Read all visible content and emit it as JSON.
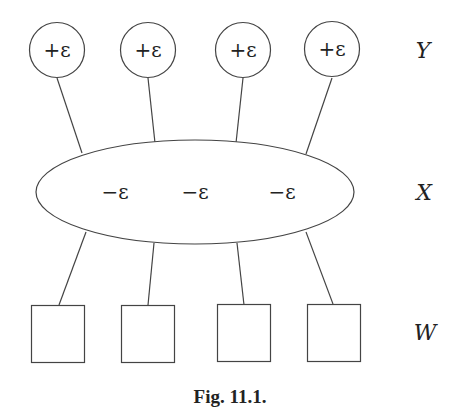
{
  "diagram": {
    "type": "factor-graph",
    "rows": {
      "top": {
        "label": "Y",
        "shape": "circle",
        "node_labels": [
          "+ε",
          "+ε",
          "+ε",
          "+ε"
        ]
      },
      "middle": {
        "label": "X",
        "shape": "ellipse",
        "node_labels": [
          "−ε",
          "−ε",
          "−ε"
        ]
      },
      "bottom": {
        "label": "W",
        "shape": "square",
        "node_labels": [
          "",
          "",
          "",
          ""
        ]
      }
    },
    "edges": [
      {
        "from": "Y1",
        "to": "X"
      },
      {
        "from": "Y2",
        "to": "X"
      },
      {
        "from": "Y3",
        "to": "X"
      },
      {
        "from": "Y4",
        "to": "X"
      },
      {
        "from": "X",
        "to": "W1"
      },
      {
        "from": "X",
        "to": "W2"
      },
      {
        "from": "X",
        "to": "W3"
      },
      {
        "from": "X",
        "to": "W4"
      }
    ],
    "caption": "Fig. 11.1."
  }
}
